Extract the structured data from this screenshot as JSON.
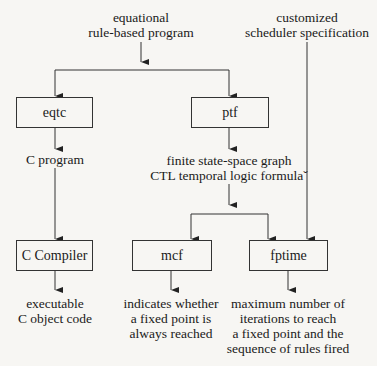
{
  "inputs": {
    "program": [
      "equational",
      "rule-based program"
    ],
    "scheduler": [
      "customized",
      "scheduler specification"
    ]
  },
  "boxes": {
    "eqtc": "eqtc",
    "ptf": "ptf",
    "ccompiler": "C Compiler",
    "mcf": "mcf",
    "fptime": "fptime"
  },
  "intermediate": {
    "c_program": "C program",
    "ptf_output": [
      "finite state-space graph",
      "CTL temporal logic formulaˇ"
    ]
  },
  "outputs": {
    "ccompiler": [
      "executable",
      "C object code"
    ],
    "mcf": [
      "indicates whether",
      "a fixed point is",
      "always reached"
    ],
    "fptime": [
      "maximum number of",
      "iterations to reach",
      "a fixed point and the",
      "sequence of rules fired"
    ]
  }
}
